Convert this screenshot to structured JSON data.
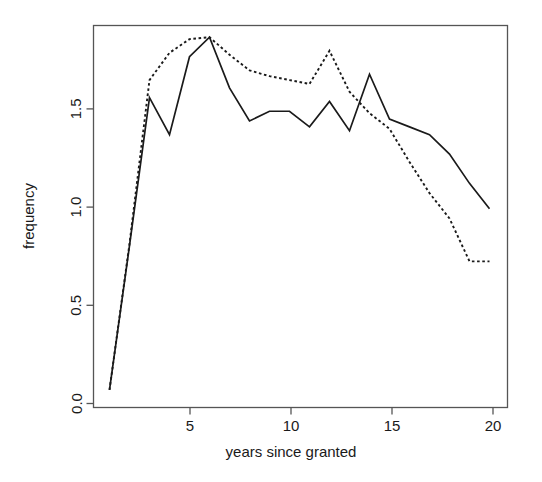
{
  "chart_data": {
    "type": "line",
    "title": "",
    "xlabel": "years since granted",
    "ylabel": "frequency",
    "xlim": [
      0.2,
      20.9
    ],
    "ylim": [
      -0.04,
      1.92
    ],
    "xticks": [
      5,
      10,
      15,
      20
    ],
    "xtick_labels": [
      "5",
      "10",
      "15",
      "20"
    ],
    "yticks": [
      0.0,
      0.5,
      1.0,
      1.5
    ],
    "ytick_labels": [
      "0.0",
      "0.5",
      "1.0",
      "1.5"
    ],
    "grid": false,
    "legend": "none",
    "frame": "box",
    "line_color": "#1a1a1a",
    "x": [
      1,
      2,
      3,
      4,
      5,
      6,
      7,
      8,
      9,
      10,
      11,
      12,
      13,
      14,
      15,
      16,
      17,
      18,
      19,
      20
    ],
    "series": [
      {
        "name": "solid",
        "style": "solid",
        "values": [
          0.05,
          0.79,
          1.55,
          1.36,
          1.76,
          1.86,
          1.6,
          1.43,
          1.48,
          1.48,
          1.4,
          1.53,
          1.38,
          1.67,
          1.44,
          1.4,
          1.36,
          1.26,
          1.11,
          0.98
        ]
      },
      {
        "name": "dotted",
        "style": "dotted",
        "values": [
          0.05,
          0.8,
          1.64,
          1.78,
          1.85,
          1.86,
          1.77,
          1.69,
          1.66,
          1.64,
          1.62,
          1.79,
          1.58,
          1.47,
          1.39,
          1.22,
          1.06,
          0.93,
          0.71,
          0.71
        ]
      }
    ]
  }
}
